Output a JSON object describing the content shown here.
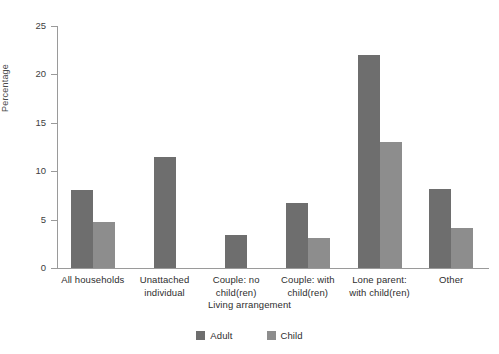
{
  "chart_data": {
    "type": "bar",
    "title": "",
    "subtitle": "",
    "xlabel": "Living arrangement",
    "ylabel": "Percentage",
    "ylim": [
      0,
      25
    ],
    "yticks": [
      0,
      5,
      10,
      15,
      20,
      25
    ],
    "grid": false,
    "legend_position": "bottom-center",
    "categories": [
      "All households",
      "Unattached individual",
      "Couple: no child(ren)",
      "Couple: with child(ren)",
      "Lone parent: with child(ren)",
      "Other"
    ],
    "category_label_lines": [
      [
        "All households"
      ],
      [
        "Unattached",
        "individual"
      ],
      [
        "Couple: no",
        "child(ren)"
      ],
      [
        "Couple: with",
        "child(ren)"
      ],
      [
        "Lone parent:",
        "with child(ren)"
      ],
      [
        "Other"
      ]
    ],
    "series": [
      {
        "name": "Adult",
        "color": "#6e6e6e",
        "values": [
          8.1,
          11.5,
          3.4,
          6.7,
          22.0,
          8.2
        ]
      },
      {
        "name": "Child",
        "color": "#8d8d8d",
        "values": [
          4.8,
          0,
          0,
          3.1,
          13.0,
          4.1
        ]
      }
    ]
  },
  "axes": {
    "y_title": "Percentage",
    "x_title": "Living arrangement",
    "tick_labels": [
      "0",
      "5",
      "10",
      "15",
      "20",
      "25"
    ]
  },
  "legend": {
    "items": [
      {
        "label": "Adult",
        "color": "#6e6e6e"
      },
      {
        "label": "Child",
        "color": "#8d8d8d"
      }
    ]
  },
  "colors": {
    "adult": "#6e6e6e",
    "child": "#8d8d8d",
    "axis": "#9a9a9a",
    "text": "#2e2e2e",
    "background": "#ffffff"
  }
}
